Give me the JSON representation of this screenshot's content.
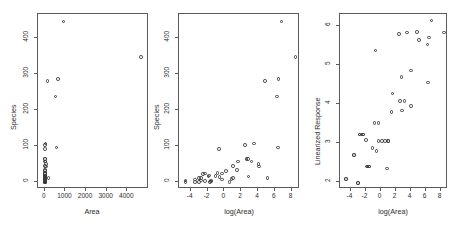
{
  "figure": {
    "background": "#ffffff",
    "point_color": "#3b3b3b",
    "axis_color": "#5a5a5a",
    "panel_count": 3
  },
  "chart_data": [
    {
      "type": "scatter",
      "title": "",
      "xlabel": "Area",
      "ylabel": "Species",
      "xlim": [
        -330,
        5050
      ],
      "ylim": [
        -18,
        465
      ],
      "xticks": [
        0,
        1000,
        2000,
        3000,
        4000
      ],
      "xticklabels": [
        "0",
        "1000",
        "2000",
        "3000",
        "4000"
      ],
      "yticks": [
        0,
        100,
        200,
        300,
        400
      ],
      "yticklabels": [
        "0",
        "100",
        "200",
        "300",
        "400"
      ],
      "grid": false,
      "legend": "none",
      "marker": "open-circle",
      "points": [
        {
          "x": 25.09,
          "y": 58
        },
        {
          "x": 1.24,
          "y": 31
        },
        {
          "x": 0.21,
          "y": 3
        },
        {
          "x": 0.1,
          "y": 25
        },
        {
          "x": 0.05,
          "y": 2
        },
        {
          "x": 0.34,
          "y": 18
        },
        {
          "x": 0.08,
          "y": 24
        },
        {
          "x": 2.33,
          "y": 10
        },
        {
          "x": 0.03,
          "y": 8
        },
        {
          "x": 1.84,
          "y": 2
        },
        {
          "x": 572.33,
          "y": 97
        },
        {
          "x": 0.51,
          "y": 93
        },
        {
          "x": 4.89,
          "y": 58
        },
        {
          "x": 4669.32,
          "y": 347
        },
        {
          "x": 58.27,
          "y": 51
        },
        {
          "x": 0.78,
          "y": 25
        },
        {
          "x": 0.18,
          "y": 2
        },
        {
          "x": 0.01,
          "y": 6
        },
        {
          "x": 129.49,
          "y": 280
        },
        {
          "x": 16.84,
          "y": 65
        },
        {
          "x": 59.56,
          "y": 44
        },
        {
          "x": 17.35,
          "y": 16
        },
        {
          "x": 0.57,
          "y": 15
        },
        {
          "x": 0.78,
          "y": 8
        },
        {
          "x": 173.0,
          "y": 12
        },
        {
          "x": 4.41,
          "y": 35
        },
        {
          "x": 634.49,
          "y": 285
        },
        {
          "x": 0.21,
          "y": 5
        },
        {
          "x": 2.85,
          "y": 45
        },
        {
          "x": 0.1,
          "y": 4
        },
        {
          "x": 0.05,
          "y": 12
        },
        {
          "x": 903.82,
          "y": 444
        },
        {
          "x": 11.75,
          "y": 104
        },
        {
          "x": 0.06,
          "y": 13
        },
        {
          "x": 0.15,
          "y": 16
        },
        {
          "x": 0.44,
          "y": 26
        },
        {
          "x": 13.89,
          "y": 65
        },
        {
          "x": 525.01,
          "y": 237
        },
        {
          "x": 0.03,
          "y": 2
        },
        {
          "x": 0.06,
          "y": 5
        },
        {
          "x": 0.01,
          "y": 1
        },
        {
          "x": 34.05,
          "y": 108
        },
        {
          "x": 2.75,
          "y": 13
        },
        {
          "x": 0.16,
          "y": 19
        }
      ]
    },
    {
      "type": "scatter",
      "title": "",
      "xlabel": "log(Area)",
      "ylabel": "Species",
      "xlim": [
        -5.4,
        9.0
      ],
      "ylim": [
        -18,
        465
      ],
      "xticks": [
        -4,
        -2,
        0,
        2,
        4,
        6,
        8
      ],
      "xticklabels": [
        "-4",
        "-2",
        "0",
        "2",
        "4",
        "6",
        "8"
      ],
      "yticks": [
        0,
        100,
        200,
        300,
        400
      ],
      "yticklabels": [
        "0",
        "100",
        "200",
        "300",
        "400"
      ],
      "grid": false,
      "legend": "none",
      "marker": "open-circle",
      "points": [
        {
          "x": 3.22,
          "y": 58
        },
        {
          "x": 0.22,
          "y": 31
        },
        {
          "x": -1.56,
          "y": 3
        },
        {
          "x": -2.3,
          "y": 25
        },
        {
          "x": -3.0,
          "y": 2
        },
        {
          "x": -1.08,
          "y": 18
        },
        {
          "x": -2.53,
          "y": 24
        },
        {
          "x": 0.85,
          "y": 10
        },
        {
          "x": -3.51,
          "y": 8
        },
        {
          "x": 0.61,
          "y": 2
        },
        {
          "x": 6.35,
          "y": 97
        },
        {
          "x": -0.67,
          "y": 93
        },
        {
          "x": 1.59,
          "y": 58
        },
        {
          "x": 8.45,
          "y": 347
        },
        {
          "x": 4.07,
          "y": 51
        },
        {
          "x": -0.25,
          "y": 25
        },
        {
          "x": -1.71,
          "y": 2
        },
        {
          "x": -4.61,
          "y": 6
        },
        {
          "x": 4.86,
          "y": 280
        },
        {
          "x": 2.82,
          "y": 65
        },
        {
          "x": 4.09,
          "y": 44
        },
        {
          "x": 2.85,
          "y": 16
        },
        {
          "x": -0.56,
          "y": 15
        },
        {
          "x": -0.25,
          "y": 8
        },
        {
          "x": 5.15,
          "y": 12
        },
        {
          "x": 1.48,
          "y": 35
        },
        {
          "x": 6.45,
          "y": 285
        },
        {
          "x": -1.56,
          "y": 5
        },
        {
          "x": 1.05,
          "y": 45
        },
        {
          "x": -2.3,
          "y": 4
        },
        {
          "x": -3.0,
          "y": 12
        },
        {
          "x": 6.81,
          "y": 444
        },
        {
          "x": 2.46,
          "y": 104
        },
        {
          "x": -2.81,
          "y": 13
        },
        {
          "x": -1.9,
          "y": 16
        },
        {
          "x": -0.82,
          "y": 26
        },
        {
          "x": 2.63,
          "y": 65
        },
        {
          "x": 6.26,
          "y": 237
        },
        {
          "x": -3.51,
          "y": 2
        },
        {
          "x": -2.81,
          "y": 5
        },
        {
          "x": -4.61,
          "y": 1
        },
        {
          "x": 3.53,
          "y": 108
        },
        {
          "x": 1.01,
          "y": 13
        },
        {
          "x": -1.83,
          "y": 19
        }
      ]
    },
    {
      "type": "scatter",
      "title": "",
      "xlabel": "log(Area)",
      "ylabel": "Linearized Response",
      "xlim": [
        -5.4,
        9.0
      ],
      "ylim": [
        1.82,
        6.32
      ],
      "xticks": [
        -4,
        -2,
        0,
        2,
        4,
        6,
        8
      ],
      "xticklabels": [
        "-4",
        "-2",
        "0",
        "2",
        "4",
        "6",
        "8"
      ],
      "yticks": [
        2,
        3,
        4,
        5,
        6
      ],
      "yticklabels": [
        "2",
        "3",
        "4",
        "5",
        "6"
      ],
      "grid": false,
      "legend": "none",
      "marker": "open-circle",
      "points": [
        {
          "x": 3.22,
          "y": 4.08
        },
        {
          "x": 0.22,
          "y": 3.06
        },
        {
          "x": -1.56,
          "y": 2.4
        },
        {
          "x": -2.3,
          "y": 3.22
        },
        {
          "x": -3.0,
          "y": 1.98
        },
        {
          "x": -1.08,
          "y": 2.88
        },
        {
          "x": -2.53,
          "y": 3.22
        },
        {
          "x": 0.85,
          "y": 2.35
        },
        {
          "x": -3.51,
          "y": 2.69
        },
        {
          "x": 0.61,
          "y": 3.06
        },
        {
          "x": 6.35,
          "y": 4.56
        },
        {
          "x": -0.67,
          "y": 5.38
        },
        {
          "x": 1.59,
          "y": 4.28
        },
        {
          "x": 8.45,
          "y": 5.84
        },
        {
          "x": 4.07,
          "y": 4.87
        },
        {
          "x": -0.25,
          "y": 3.52
        },
        {
          "x": -1.71,
          "y": 2.4
        },
        {
          "x": -4.61,
          "y": 2.08
        },
        {
          "x": 4.86,
          "y": 5.86
        },
        {
          "x": 2.82,
          "y": 4.7
        },
        {
          "x": 4.09,
          "y": 3.95
        },
        {
          "x": 2.85,
          "y": 3.84
        },
        {
          "x": -0.56,
          "y": 2.79
        },
        {
          "x": -0.25,
          "y": 3.06
        },
        {
          "x": 5.15,
          "y": 5.65
        },
        {
          "x": 1.48,
          "y": 3.8
        },
        {
          "x": 6.45,
          "y": 5.72
        },
        {
          "x": -1.56,
          "y": 2.4
        },
        {
          "x": 1.05,
          "y": 3.06
        },
        {
          "x": -2.3,
          "y": 3.22
        },
        {
          "x": -3.0,
          "y": 1.98
        },
        {
          "x": 6.81,
          "y": 6.15
        },
        {
          "x": 2.46,
          "y": 5.8
        },
        {
          "x": -2.81,
          "y": 3.22
        },
        {
          "x": -1.9,
          "y": 3.08
        },
        {
          "x": -0.82,
          "y": 3.52
        },
        {
          "x": 2.63,
          "y": 4.09
        },
        {
          "x": 6.26,
          "y": 5.54
        },
        {
          "x": -3.51,
          "y": 2.69
        },
        {
          "x": -2.81,
          "y": 3.22
        },
        {
          "x": -4.61,
          "y": 2.08
        },
        {
          "x": 3.53,
          "y": 5.84
        },
        {
          "x": 1.01,
          "y": 3.06
        },
        {
          "x": -1.83,
          "y": 2.4
        }
      ]
    }
  ]
}
